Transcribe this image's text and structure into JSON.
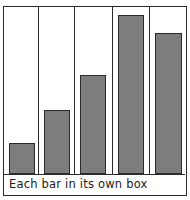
{
  "chart_data": {
    "type": "bar",
    "title": "",
    "caption": "Each bar in its own box",
    "categories": [
      "1",
      "2",
      "3",
      "4",
      "5"
    ],
    "values": [
      31,
      64,
      99,
      159,
      141
    ],
    "xlabel": "",
    "ylabel": "",
    "ylim": [
      0,
      167
    ],
    "grid": false,
    "legend": null,
    "bar_color": "#7d7d7d",
    "style": "hand-drawn, each bar enclosed in its own vertical box"
  }
}
